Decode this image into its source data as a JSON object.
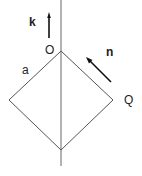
{
  "diagram": {
    "labels": {
      "k": "k",
      "o": "O",
      "n": "n",
      "a": "a",
      "q": "Q"
    },
    "colors": {
      "line": "#555555",
      "arrow": "#111111"
    }
  }
}
